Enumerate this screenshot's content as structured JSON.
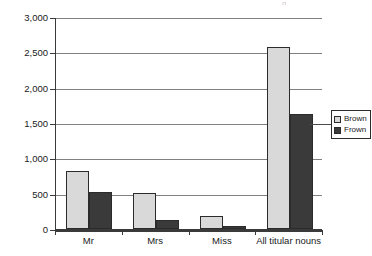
{
  "chart_data": {
    "type": "bar",
    "title": "",
    "subtitle": "",
    "xlabel": "",
    "ylabel": "",
    "categories": [
      "Mr",
      "Mrs",
      "Miss",
      "All titular nouns"
    ],
    "series": [
      {
        "name": "Brown",
        "color": "#d9d9d9",
        "values": [
          820,
          510,
          185,
          2570
        ]
      },
      {
        "name": "Frown",
        "color": "#3a3a3a",
        "values": [
          525,
          130,
          40,
          1630
        ]
      }
    ],
    "ylim": [
      0,
      3000
    ],
    "y_ticks": [
      0,
      500,
      1000,
      1500,
      2000,
      2500,
      3000
    ],
    "y_tick_labels": [
      "0",
      "500",
      "1,000",
      "1,500",
      "2,000",
      "2,500",
      "3,000"
    ],
    "grid": true,
    "legend_position": "right",
    "legend_entries": [
      "Brown",
      "Frown"
    ]
  },
  "axes": {
    "y_tick_labels": [
      "3,000",
      "2,500",
      "2,000",
      "1,500",
      "1,000",
      "500",
      "0"
    ],
    "x_tick_labels": [
      "Mr",
      "Mrs",
      "Miss",
      "All titular nouns"
    ]
  },
  "legend": {
    "items": [
      {
        "label": "Brown",
        "color": "#d9d9d9"
      },
      {
        "label": "Frown",
        "color": "#3a3a3a"
      }
    ]
  },
  "colors": {
    "brown_series": "#d9d9d9",
    "frown_series": "#3a3a3a",
    "gridline": "#808080",
    "axis": "#3a3a3a",
    "background": "#ffffff"
  }
}
